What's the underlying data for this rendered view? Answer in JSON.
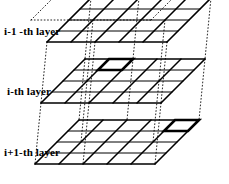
{
  "figure": {
    "background_color": "#ffffff",
    "line_color": "#000000",
    "width": 229,
    "height": 184
  },
  "labels": {
    "top": "i-1 -th layer",
    "middle": "i-th layer",
    "bottom": "i+1-th layer"
  },
  "chart_data": {
    "type": "diagram",
    "layer_count": 3,
    "grid_columns": 5,
    "grid_rows": 4,
    "layers": [
      {
        "name": "i-1 -th layer",
        "index": "i-1",
        "position": "top",
        "columns": 5,
        "rows": 4,
        "highlighted_cell": null
      },
      {
        "name": "i-th layer",
        "index": "i",
        "position": "middle",
        "columns": 5,
        "rows": 4,
        "highlighted_cell": {
          "column": 1,
          "row": 3
        }
      },
      {
        "name": "i+1-th layer",
        "index": "i+1",
        "position": "bottom",
        "columns": 5,
        "rows": 4,
        "highlighted_cell": {
          "column": 4,
          "row": 3
        }
      }
    ],
    "connectors": {
      "style": "dotted",
      "color": "#000000",
      "description": "Dotted lines fan between corresponding corners and interior nodes of adjacent layers"
    }
  },
  "geometry": {
    "cell_w": 24.0,
    "cell_h": 11.0,
    "skew_x": 11.0,
    "layer_origins": [
      {
        "x": 47.0,
        "y": 42.0
      },
      {
        "x": 41.0,
        "y": 103.0
      },
      {
        "x": 35.0,
        "y": 164.0
      }
    ]
  }
}
